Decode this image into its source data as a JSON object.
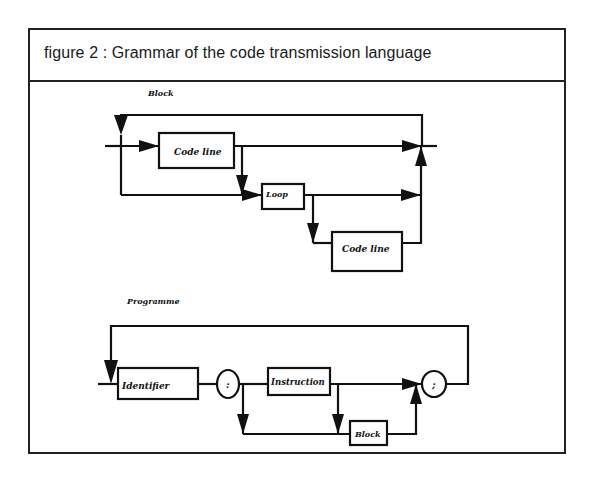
{
  "figure": {
    "title": "figure 2 : Grammar of the code transmission language"
  },
  "diagrams": {
    "block": {
      "heading": "Block",
      "nodes": [
        {
          "id": "code-line-1",
          "label": "Code line",
          "shape": "rect"
        },
        {
          "id": "loop",
          "label": "Loop",
          "shape": "rect"
        },
        {
          "id": "code-line-2",
          "label": "Code line",
          "shape": "rect"
        }
      ]
    },
    "programme": {
      "heading": "Programme",
      "nodes": [
        {
          "id": "identifier",
          "label": "Identifier",
          "shape": "rect"
        },
        {
          "id": "colon",
          "label": ":",
          "shape": "circle"
        },
        {
          "id": "instruction",
          "label": "Instruction",
          "shape": "rect"
        },
        {
          "id": "block",
          "label": "Block",
          "shape": "rect"
        },
        {
          "id": "semicolon",
          "label": ";",
          "shape": "circle"
        }
      ]
    }
  },
  "colors": {
    "stroke": "#111111",
    "background": "#ffffff"
  }
}
